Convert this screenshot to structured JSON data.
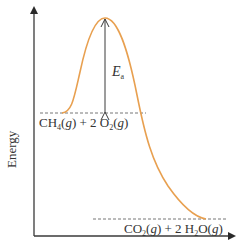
{
  "diagram": {
    "type": "reaction-energy-profile",
    "y_axis_label": "Energy",
    "activation_energy_label": {
      "symbol": "E",
      "subscript": "a"
    },
    "reactants": {
      "label_parts": [
        "CH",
        "4",
        "(",
        "g",
        ") + 2 O",
        "2",
        "(",
        "g",
        ")"
      ],
      "formula_text": "CH4(g) + 2 O2(g)"
    },
    "products": {
      "label_parts": [
        "CO",
        "2",
        "(",
        "g",
        ") + 2 H",
        "2",
        "O(",
        "g",
        ")"
      ],
      "formula_text": "CO2(g) + 2 H2O(g)"
    },
    "colors": {
      "curve": "#E8A050",
      "axes": "#3a3a3a",
      "dashed_lines": "#666666",
      "arrow": "#3a3a3a"
    }
  }
}
